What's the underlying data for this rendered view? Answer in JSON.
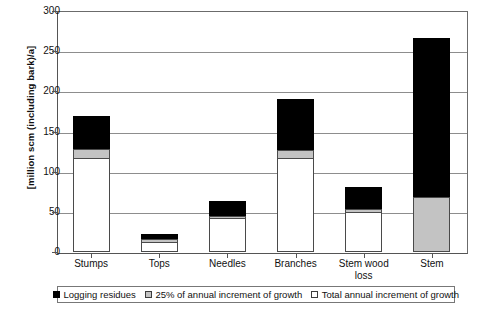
{
  "chart_data": {
    "type": "bar",
    "subtype": "overlaid-stacked",
    "title": "",
    "xlabel": "",
    "ylabel": "[million scm (including bark)/a]",
    "ylim": [
      0,
      300
    ],
    "yticks": [
      0,
      50,
      100,
      150,
      200,
      250,
      300
    ],
    "grid": true,
    "legend_position": "bottom",
    "categories": [
      "Stumps",
      "Tops",
      "Needles",
      "Branches",
      "Stem wood loss",
      "Stem"
    ],
    "series": [
      {
        "name": "Logging residues",
        "color": "#000000",
        "values": [
          117,
          13,
          42,
          117,
          50,
          0
        ]
      },
      {
        "name": "25% of annual increment of growth",
        "color": "#c3c3c3",
        "values": [
          128,
          16,
          45,
          127,
          54,
          68
        ]
      },
      {
        "name": "Total annual increment of growth",
        "color": "#ffffff",
        "values": [
          169,
          22,
          63,
          190,
          81,
          267
        ]
      }
    ]
  },
  "axis": {
    "y_title": "[million scm (including bark)/a]",
    "y_tick_labels": [
      "300",
      "250",
      "200",
      "150",
      "100",
      "50",
      "0"
    ],
    "x_tick_labels": [
      "Stumps",
      "Tops",
      "Needles",
      "Branches",
      "Stem wood loss",
      "Stem"
    ]
  },
  "legend": {
    "items": [
      {
        "label": "Logging residues",
        "swatch": "black-swatch-icon"
      },
      {
        "label": "25% of annual increment of growth",
        "swatch": "gray-swatch-icon"
      },
      {
        "label": "Total annual increment of growth",
        "swatch": "white-swatch-icon"
      }
    ]
  }
}
